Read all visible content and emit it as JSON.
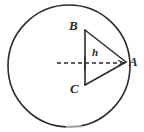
{
  "figure": {
    "name": "circle-with-inscribed-triangle",
    "background_color": "#ffffff",
    "stroke_color": "#2b2b2b"
  },
  "circle": {
    "name": "outer-circle",
    "center_x": 69,
    "center_y": 66,
    "radius": 61,
    "stroke_color": "#2b2b2b",
    "stroke_width": 1.6,
    "fill": "none"
  },
  "triangle": {
    "name": "triangle-ABC",
    "stroke_color": "#2b2b2b",
    "stroke_width": 1.5,
    "fill": "none",
    "vertices": [
      {
        "label": "B",
        "x": 85,
        "y": 30,
        "label_x": 69,
        "label_y": 19
      },
      {
        "label": "C",
        "x": 85,
        "y": 85,
        "label_x": 70,
        "label_y": 82
      },
      {
        "label": "A",
        "x": 126,
        "y": 62,
        "label_x": 129,
        "label_y": 55
      }
    ],
    "edges": [
      {
        "name": "edge-BC",
        "from": "B",
        "to": "C"
      },
      {
        "name": "edge-BA",
        "from": "B",
        "to": "A"
      },
      {
        "name": "edge-CA",
        "from": "C",
        "to": "A"
      }
    ]
  },
  "dimension": {
    "name": "height-h",
    "label": "h",
    "label_x": 92,
    "label_y": 47,
    "line": {
      "x1": 57,
      "y1": 63,
      "x2": 124,
      "y2": 63,
      "dash_pattern": "4 3",
      "stroke_color": "#2b2b2b",
      "stroke_width": 1.3,
      "arrowhead_at": "A"
    },
    "tick": {
      "name": "intersection-tick",
      "x": 85,
      "y_top": 57,
      "y_bottom": 70
    }
  },
  "labels": {
    "B": "B",
    "C": "C",
    "A": "A",
    "h": "h"
  }
}
